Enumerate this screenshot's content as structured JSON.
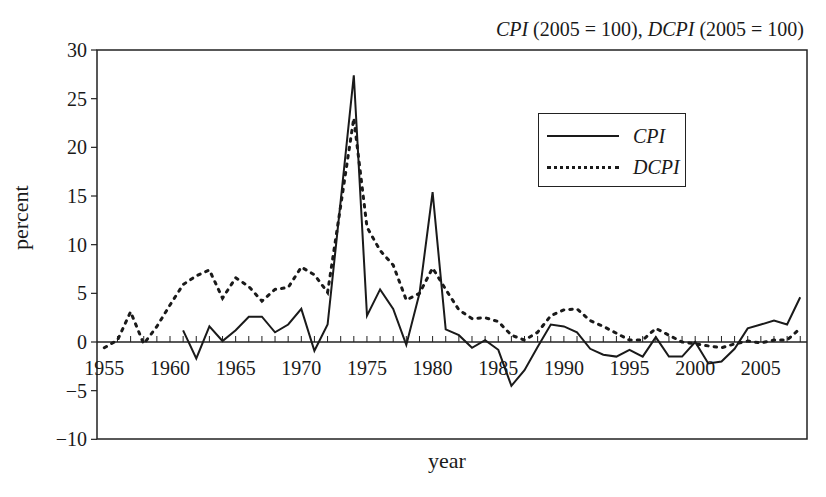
{
  "chart_data": {
    "type": "line",
    "title": "CPI (2005 = 100), DCPI (2005 = 100)",
    "title_parts": {
      "s1": "CPI",
      "s1_base": " (2005 = 100), ",
      "s2": "DCPI",
      "s2_base": " (2005 = 100)"
    },
    "xlabel": "year",
    "ylabel": "percent",
    "xlim": [
      1955,
      2008.5
    ],
    "ylim": [
      -10,
      30
    ],
    "yticks": [
      -10,
      -5,
      0,
      5,
      10,
      15,
      20,
      25,
      30
    ],
    "xticks": [
      1955,
      1960,
      1965,
      1970,
      1975,
      1980,
      1985,
      1990,
      1995,
      2000,
      2005
    ],
    "grid": false,
    "legend_position": "upper right (inside)",
    "series": [
      {
        "name": "CPI",
        "style": "solid",
        "x": [
          1961,
          1962,
          1963,
          1964,
          1965,
          1966,
          1967,
          1968,
          1969,
          1970,
          1971,
          1972,
          1973,
          1974,
          1975,
          1976,
          1977,
          1978,
          1979,
          1980,
          1981,
          1982,
          1983,
          1984,
          1985,
          1986,
          1987,
          1988,
          1989,
          1990,
          1991,
          1992,
          1993,
          1994,
          1995,
          1996,
          1997,
          1998,
          1999,
          2000,
          2001,
          2002,
          2003,
          2004,
          2005,
          2006,
          2007,
          2008
        ],
        "values": [
          1.2,
          -1.7,
          1.6,
          0.1,
          1.2,
          2.6,
          2.6,
          1.0,
          1.8,
          3.4,
          -0.9,
          1.8,
          14.5,
          27.4,
          2.7,
          5.4,
          3.4,
          -0.3,
          5.0,
          15.4,
          1.3,
          0.7,
          -0.6,
          0.2,
          -0.8,
          -4.5,
          -2.9,
          -0.5,
          1.8,
          1.6,
          1.0,
          -0.7,
          -1.3,
          -1.5,
          -0.8,
          -1.5,
          0.5,
          -1.5,
          -1.5,
          0.0,
          -2.2,
          -2.0,
          -0.7,
          1.4,
          1.8,
          2.2,
          1.8,
          4.6
        ]
      },
      {
        "name": "DCPI",
        "style": "dotted",
        "x": [
          1955,
          1956,
          1957,
          1958,
          1959,
          1960,
          1961,
          1962,
          1963,
          1964,
          1965,
          1966,
          1967,
          1968,
          1969,
          1970,
          1971,
          1972,
          1973,
          1974,
          1975,
          1976,
          1977,
          1978,
          1979,
          1980,
          1981,
          1982,
          1983,
          1984,
          1985,
          1986,
          1987,
          1988,
          1989,
          1990,
          1991,
          1992,
          1993,
          1994,
          1995,
          1996,
          1997,
          1998,
          1999,
          2000,
          2001,
          2002,
          2003,
          2004,
          2005,
          2006,
          2007,
          2008
        ],
        "values": [
          -0.6,
          0.2,
          3.1,
          -0.2,
          1.6,
          3.8,
          5.9,
          6.8,
          7.4,
          4.5,
          6.6,
          5.7,
          4.2,
          5.4,
          5.6,
          7.7,
          6.9,
          5.1,
          14.0,
          23.0,
          11.8,
          9.4,
          7.9,
          4.3,
          5.0,
          7.6,
          5.4,
          3.3,
          2.4,
          2.5,
          2.1,
          0.7,
          0.2,
          1.0,
          2.7,
          3.3,
          3.4,
          2.2,
          1.6,
          0.9,
          0.2,
          0.2,
          1.4,
          0.7,
          0.0,
          -0.2,
          -0.4,
          -0.6,
          -0.2,
          0.1,
          -0.1,
          0.2,
          0.2,
          1.4
        ]
      }
    ]
  },
  "legend": {
    "items": [
      {
        "label": "CPI"
      },
      {
        "label": "DCPI"
      }
    ]
  }
}
